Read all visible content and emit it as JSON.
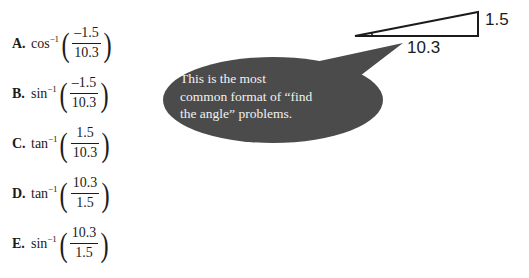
{
  "choices": [
    {
      "letter": "A.",
      "function": "cos",
      "inverse": "−1",
      "numerator": "–1.5",
      "denominator": "10.3"
    },
    {
      "letter": "B.",
      "function": "sin",
      "inverse": "−1",
      "numerator": "–1.5",
      "denominator": "10.3"
    },
    {
      "letter": "C.",
      "function": "tan",
      "inverse": "−1",
      "numerator": "1.5",
      "denominator": "10.3"
    },
    {
      "letter": "D.",
      "function": "tan",
      "inverse": "−1",
      "numerator": "10.3",
      "denominator": "1.5"
    },
    {
      "letter": "E.",
      "function": "sin",
      "inverse": "−1",
      "numerator": "10.3",
      "denominator": "1.5"
    }
  ],
  "diagram": {
    "vertical_label": "1.5",
    "horizontal_label": "10.3",
    "stroke_color": "#1b1b1b"
  },
  "callout": {
    "line1": "This is the most",
    "line2": "common format of “find",
    "line3": "the angle” problems.",
    "bubble_color": "#4b4b4b",
    "text_color": "#f2f2f0"
  }
}
